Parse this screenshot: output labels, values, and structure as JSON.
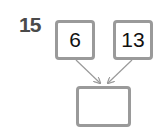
{
  "problem": {
    "number": "15",
    "inputs": [
      {
        "value": "6"
      },
      {
        "value": "13"
      }
    ],
    "answer": {
      "value": ""
    }
  },
  "colors": {
    "box_border": "#9a9a9a",
    "arrow": "#9a9a9a",
    "number": "#4a4a4a"
  }
}
